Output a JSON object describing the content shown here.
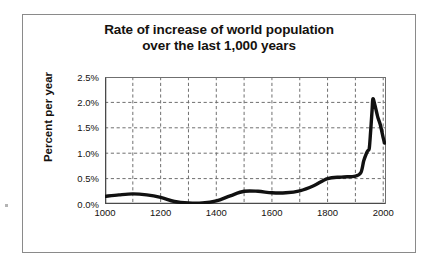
{
  "chart_data": {
    "type": "line",
    "title": "Rate of increase of world population over the last 1,000 years",
    "title_lines": [
      "Rate of increase of world population",
      "over the last 1,000 years"
    ],
    "xlabel": "",
    "ylabel": "Percent per year",
    "xlim": [
      1000,
      2010
    ],
    "ylim": [
      0.0,
      2.5
    ],
    "grid": true,
    "grid_style": "dashed",
    "legend": "none",
    "y_tick_labels": [
      "0.0%",
      "0.5%",
      "1.0%",
      "1.5%",
      "2.0%",
      "2.5%"
    ],
    "y_tick_values": [
      0.0,
      0.5,
      1.0,
      1.5,
      2.0,
      2.5
    ],
    "x_tick_labels": [
      "1000",
      "1200",
      "1400",
      "1600",
      "1800",
      "2000"
    ],
    "x_tick_values": [
      1000,
      1200,
      1400,
      1600,
      1800,
      2000
    ],
    "x_minor_tick_values": [
      1100,
      1300,
      1500,
      1700,
      1900
    ],
    "series": [
      {
        "name": "Rate of increase of world population",
        "color": "#111111",
        "line_width": 3.4,
        "x": [
          1000,
          1050,
          1100,
          1150,
          1200,
          1250,
          1300,
          1350,
          1400,
          1450,
          1500,
          1550,
          1600,
          1650,
          1700,
          1750,
          1800,
          1850,
          1900,
          1920,
          1930,
          1940,
          1945,
          1950,
          1955,
          1960,
          1963,
          1970,
          1980,
          1990,
          2000,
          2005
        ],
        "y": [
          0.15,
          0.18,
          0.2,
          0.18,
          0.13,
          0.05,
          0.02,
          0.02,
          0.06,
          0.16,
          0.25,
          0.25,
          0.22,
          0.22,
          0.26,
          0.36,
          0.5,
          0.53,
          0.55,
          0.62,
          0.85,
          1.0,
          1.05,
          1.1,
          1.45,
          1.85,
          2.07,
          1.95,
          1.72,
          1.55,
          1.3,
          1.2
        ]
      }
    ]
  }
}
